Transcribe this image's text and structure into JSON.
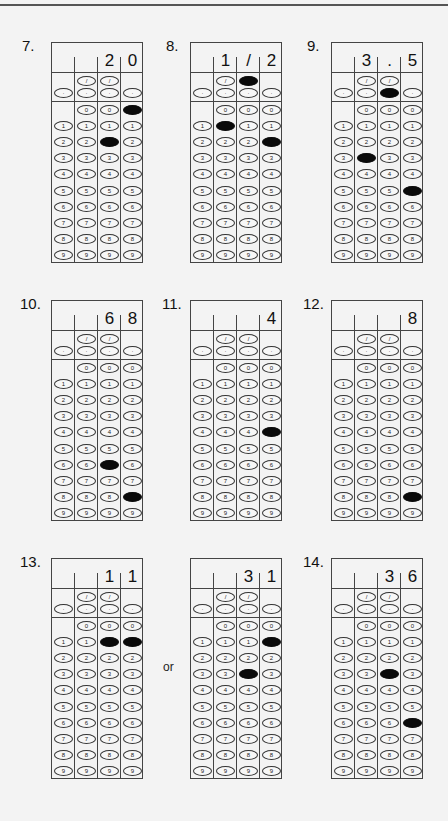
{
  "page": {
    "or_label": "or"
  },
  "symbols": {
    "fraction": "/",
    "decimal": "·"
  },
  "digits": [
    "0",
    "1",
    "2",
    "3",
    "4",
    "5",
    "6",
    "7",
    "8",
    "9"
  ],
  "grids": [
    {
      "label": "7.",
      "answer": [
        "",
        "",
        "2",
        "0"
      ],
      "filled": {
        "fraction": [
          false,
          false,
          false,
          false
        ],
        "decimal": [
          false,
          false,
          false,
          false
        ],
        "digits": [
          null,
          null,
          "2",
          "0"
        ]
      }
    },
    {
      "label": "8.",
      "answer": [
        "",
        "1",
        "/",
        "2"
      ],
      "filled": {
        "fraction": [
          false,
          false,
          true,
          false
        ],
        "decimal": [
          false,
          false,
          false,
          false
        ],
        "digits": [
          null,
          "1",
          null,
          "2"
        ]
      }
    },
    {
      "label": "9.",
      "answer": [
        "",
        "3",
        ".",
        "5"
      ],
      "filled": {
        "fraction": [
          false,
          false,
          false,
          false
        ],
        "decimal": [
          false,
          false,
          true,
          false
        ],
        "digits": [
          null,
          "3",
          null,
          "5"
        ]
      }
    },
    {
      "label": "10.",
      "answer": [
        "",
        "",
        "6",
        "8"
      ],
      "filled": {
        "fraction": [
          false,
          false,
          false,
          false
        ],
        "decimal": [
          false,
          false,
          false,
          false
        ],
        "digits": [
          null,
          null,
          "6",
          "8"
        ]
      }
    },
    {
      "label": "11.",
      "answer": [
        "",
        "",
        "",
        "4"
      ],
      "filled": {
        "fraction": [
          false,
          false,
          false,
          false
        ],
        "decimal": [
          false,
          false,
          false,
          false
        ],
        "digits": [
          null,
          null,
          null,
          "4"
        ]
      }
    },
    {
      "label": "12.",
      "answer": [
        "",
        "",
        "",
        "8"
      ],
      "filled": {
        "fraction": [
          false,
          false,
          false,
          false
        ],
        "decimal": [
          false,
          false,
          false,
          false
        ],
        "digits": [
          null,
          null,
          null,
          "8"
        ]
      }
    },
    {
      "label": "13.",
      "answer": [
        "",
        "",
        "1",
        "1"
      ],
      "filled": {
        "fraction": [
          false,
          false,
          false,
          false
        ],
        "decimal": [
          false,
          false,
          false,
          false
        ],
        "digits": [
          null,
          null,
          "1",
          "1"
        ]
      }
    },
    {
      "label": "",
      "answer": [
        "",
        "",
        "3",
        "1"
      ],
      "filled": {
        "fraction": [
          false,
          false,
          false,
          false
        ],
        "decimal": [
          false,
          false,
          false,
          false
        ],
        "digits": [
          null,
          null,
          "3",
          "1"
        ]
      }
    },
    {
      "label": "14.",
      "answer": [
        "",
        "",
        "3",
        "6"
      ],
      "filled": {
        "fraction": [
          false,
          false,
          false,
          false
        ],
        "decimal": [
          false,
          false,
          false,
          false
        ],
        "digits": [
          null,
          null,
          "3",
          "6"
        ]
      }
    }
  ]
}
